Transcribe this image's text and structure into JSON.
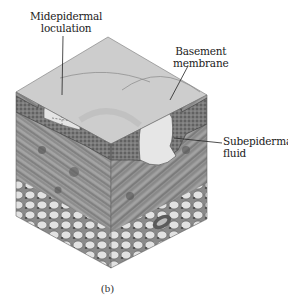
{
  "figure": {
    "caption": "(b)",
    "labels": [
      {
        "id": "midepidermal",
        "line1": "Midepidermal",
        "line2": "loculation"
      },
      {
        "id": "basement",
        "line1": "Basement",
        "line2": "membrane"
      },
      {
        "id": "subepidermal",
        "line1": "Subepidermal",
        "line2": "fluid"
      }
    ],
    "colors": {
      "background": "#ffffff",
      "top_face": "#cfcfcf",
      "epidermis": "#6a6a6a",
      "dermis": "#8c8c8c",
      "fat": "#d9d9d9",
      "fluid": "#e6e6e6",
      "ink": "#222222"
    }
  }
}
